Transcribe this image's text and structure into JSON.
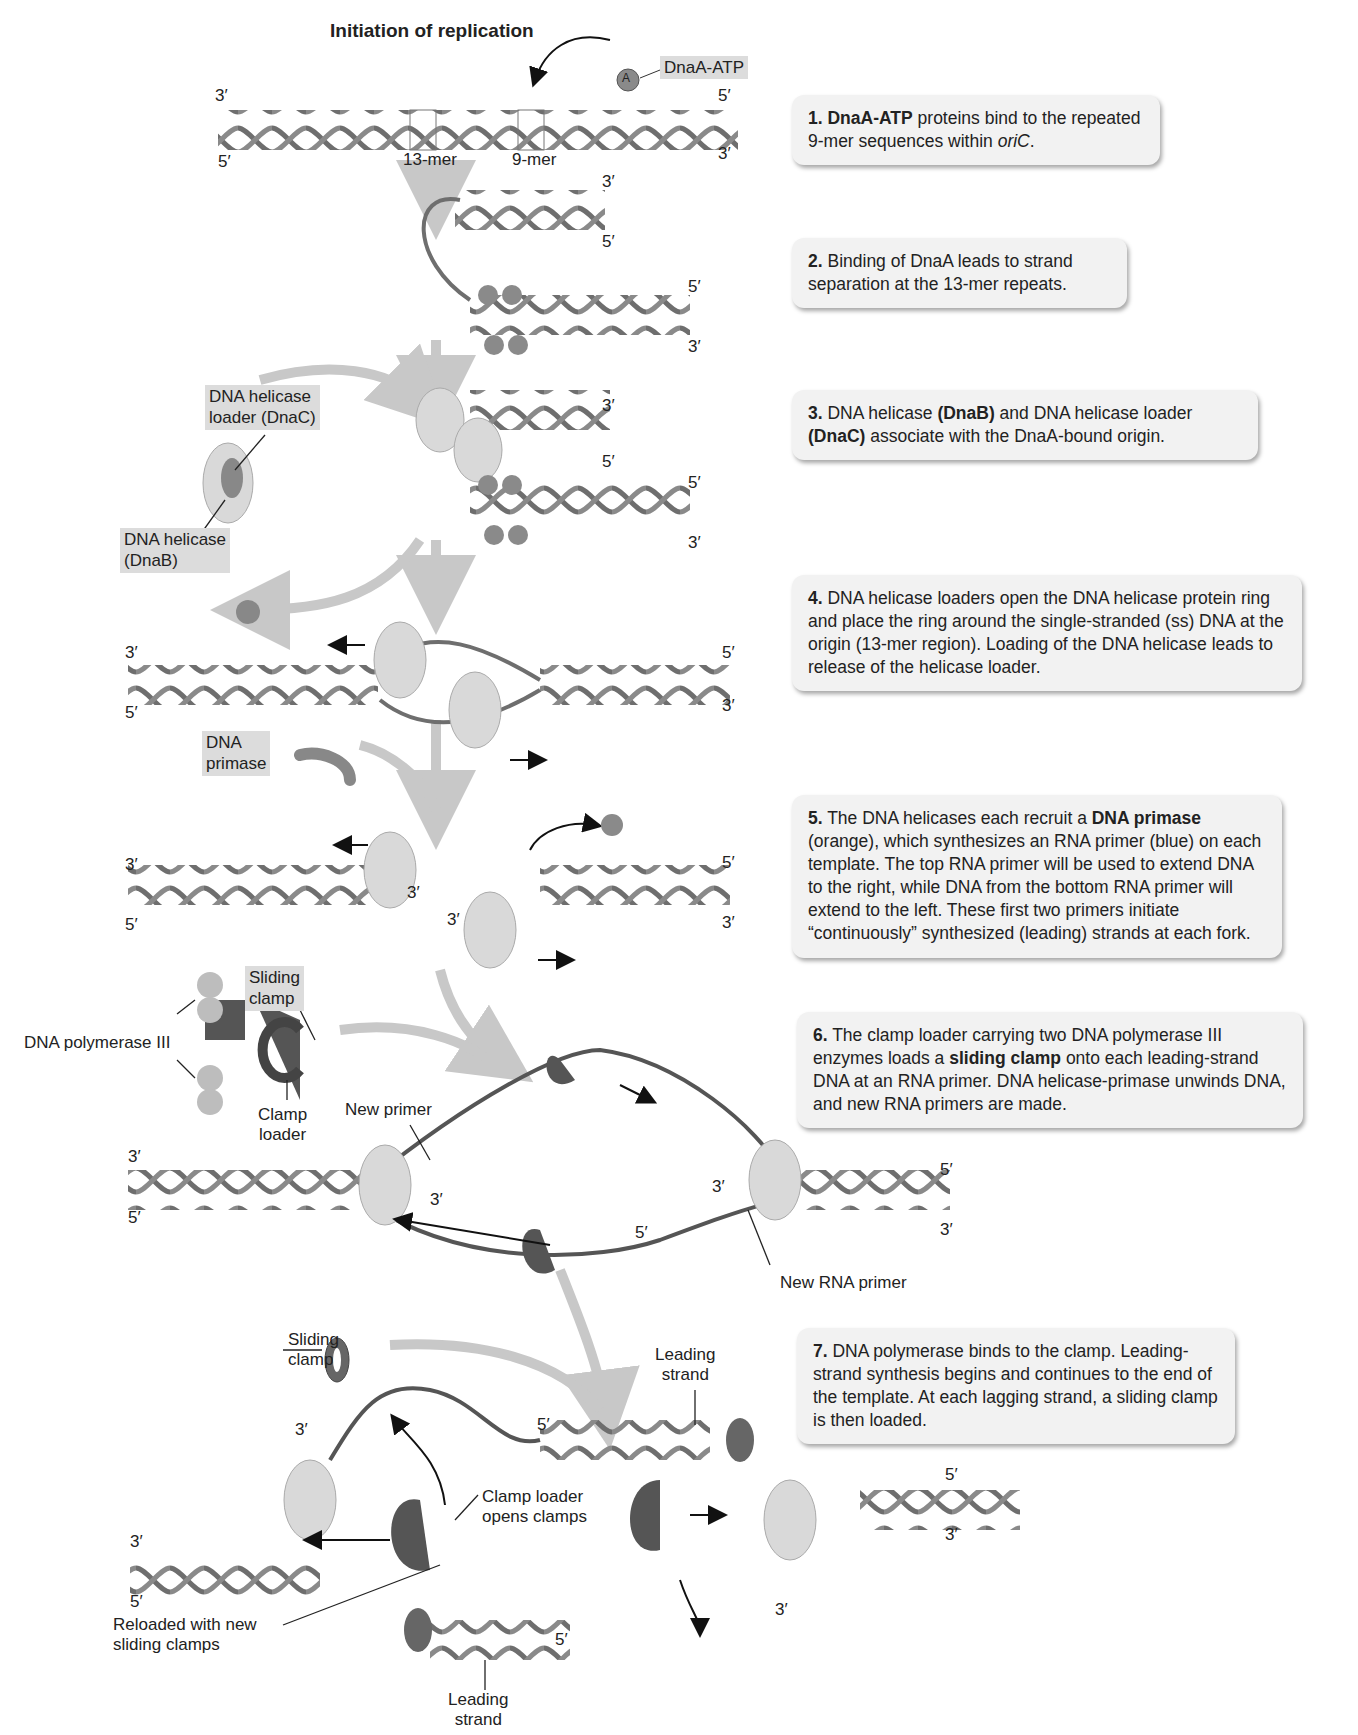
{
  "title": "Initiation of replication",
  "steps": [
    {
      "num": "1.",
      "bold": "DnaA-ATP",
      "text": " proteins bind to the repeated 9-mer sequences within ",
      "italic": "oriC",
      "tail": "."
    },
    {
      "num": "2.",
      "text": " Binding of DnaA leads to strand separation at the 13-mer repeats."
    },
    {
      "num": "3.",
      "text_a": " DNA helicase ",
      "bold_a": "(DnaB)",
      "text_b": " and DNA helicase loader ",
      "bold_b": "(DnaC)",
      "text_c": " associate with the DnaA-bound origin."
    },
    {
      "num": "4.",
      "text": " DNA helicase loaders open the DNA helicase protein ring and place the ring around the single-stranded (ss) DNA at the origin (13-mer region). Loading of the DNA helicase leads to release of the helicase loader."
    },
    {
      "num": "5.",
      "text_a": " The DNA helicases each recruit a ",
      "bold": "DNA primase",
      "text_b": " (orange), which synthesizes an RNA primer (blue) on each template. The top RNA primer will be used to extend DNA to the right, while DNA from the bottom RNA primer will extend to the left. These first two primers initiate “continuously” synthesized (leading) strands at each fork."
    },
    {
      "num": "6.",
      "text_a": " The clamp loader carrying two DNA polymerase III enzymes loads a ",
      "bold": "sliding clamp",
      "text_b": " onto each leading-strand DNA at an RNA primer. DNA helicase-primase unwinds DNA, and new RNA primers are made."
    },
    {
      "num": "7.",
      "text": " DNA polymerase binds to the clamp. Leading-strand synthesis begins and continues to the end of the template. At each lagging strand, a sliding clamp is then loaded."
    }
  ],
  "labels": {
    "dnaa_atp": "DnaA-ATP",
    "a": "A",
    "mer13": "13-mer",
    "mer9": "9-mer",
    "three_prime": "3′",
    "five_prime": "5′",
    "helicase_loader": "DNA helicase loader (DnaC)",
    "helicase_loader_l1": "DNA helicase",
    "helicase_loader_l2": "loader (DnaC)",
    "helicase_l1": "DNA helicase",
    "helicase_l2": "(DnaB)",
    "primase_l1": "DNA",
    "primase_l2": "primase",
    "sliding_clamp_l1": "Sliding",
    "sliding_clamp_l2": "clamp",
    "pol3": "DNA polymerase III",
    "clamp_loader_l1": "Clamp",
    "clamp_loader_l2": "loader",
    "new_primer": "New primer",
    "new_rna_primer": "New RNA primer",
    "leading_l1": "Leading",
    "leading_l2": "strand",
    "clamp_opens_l1": "Clamp loader",
    "clamp_opens_l2": "opens clamps",
    "reloaded_l1": "Reloaded with new",
    "reloaded_l2": "sliding clamps"
  },
  "colors": {
    "dna": "#6e6e6e",
    "helicase": "#d9d9d9",
    "clamp_loader": "#555555",
    "polymerase": "#bdbdbd",
    "arrow_flow": "#c8c8c8",
    "box_bg": "#f2f2f2"
  }
}
